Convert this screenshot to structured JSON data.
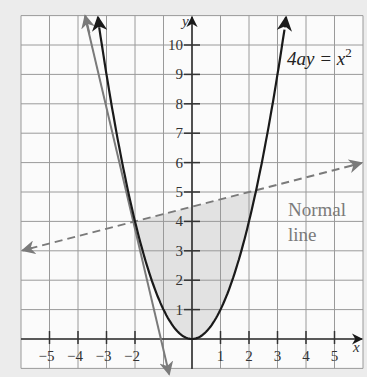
{
  "chart_data": {
    "type": "line",
    "title": "",
    "xlabel": "x",
    "ylabel": "y",
    "xlim": [
      -6,
      6
    ],
    "ylim": [
      -1,
      11
    ],
    "grid": true,
    "x_ticks": [
      -5,
      -4,
      -3,
      -2,
      1,
      2,
      3,
      4,
      5
    ],
    "y_ticks": [
      1,
      2,
      3,
      4,
      5,
      6,
      7,
      8,
      9,
      10
    ],
    "series": [
      {
        "name": "Parabola 4ay = x^2 (a = 1/4, y = x^2)",
        "style": "solid",
        "color": "#1a1a1a",
        "equation": "y = x^2",
        "points": [
          [
            -3.32,
            11
          ],
          [
            -3,
            9
          ],
          [
            -2,
            4
          ],
          [
            -1,
            1
          ],
          [
            0,
            0
          ],
          [
            1,
            1
          ],
          [
            2,
            4
          ],
          [
            3,
            9
          ],
          [
            3.32,
            11
          ]
        ]
      },
      {
        "name": "Tangent at (-2, 4)",
        "style": "solid",
        "color": "#7a7a7a",
        "equation": "y = -4x - 4",
        "points": [
          [
            -3.75,
            11
          ],
          [
            -2,
            4
          ],
          [
            -1,
            0
          ],
          [
            -0.8,
            -1.2
          ]
        ]
      },
      {
        "name": "Normal line",
        "style": "dashed",
        "color": "#7a7a7a",
        "equation": "y = (x + 2)/4 + 4",
        "points": [
          [
            -5.9,
            3.03
          ],
          [
            -2,
            4
          ],
          [
            0,
            4.5
          ],
          [
            2.25,
            5.06
          ],
          [
            5.9,
            5.98
          ]
        ]
      }
    ],
    "shaded_region": {
      "description": "Region between parabola and normal line",
      "x_range": [
        -2,
        2.25
      ],
      "color": "#e2e2e2"
    },
    "annotations": [
      {
        "text": "4ay = x²",
        "x": 3.2,
        "y": 9.8
      },
      {
        "text": "Normal",
        "x": 3.4,
        "y": 4.5
      },
      {
        "text": "line",
        "x": 3.4,
        "y": 3.5
      }
    ]
  },
  "labels": {
    "equation_main": "4ay = x",
    "equation_sup": "2",
    "normal_line_1": "Normal",
    "normal_line_2": "line",
    "x_axis": "x",
    "y_axis": "y"
  }
}
